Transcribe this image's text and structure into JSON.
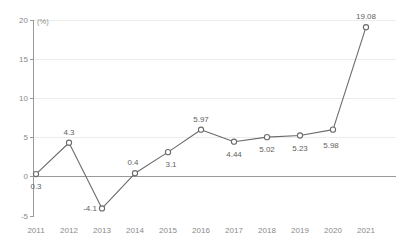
{
  "chart_data": {
    "type": "line",
    "title": "",
    "subtitle": "",
    "xlabel": "",
    "ylabel": "",
    "unit_label": "(%)",
    "categories": [
      "2011",
      "2012",
      "2013",
      "2014",
      "2015",
      "2016",
      "2017",
      "2018",
      "2019",
      "2020",
      "2021"
    ],
    "values": [
      0.3,
      4.3,
      -4.1,
      0.4,
      3.1,
      5.97,
      4.44,
      5.02,
      5.23,
      5.98,
      19.08
    ],
    "point_labels": [
      "0.3",
      "4.3",
      "-4.1",
      "0.4",
      "3.1",
      "5.97",
      "4.44",
      "5.02",
      "5.23",
      "5.98",
      "19.08"
    ],
    "label_positions": [
      "below",
      "above",
      "left",
      "above-left",
      "below-right",
      "above",
      "below",
      "below",
      "below",
      "below-left",
      "above"
    ],
    "ylim": [
      -5,
      20
    ],
    "yticks": [
      20,
      15,
      10,
      5,
      0,
      -5
    ],
    "ytick_labels": [
      "20",
      "15",
      "10",
      "5",
      "0",
      "-5"
    ],
    "grid": true,
    "grid_color": "#ececec",
    "zero_line_color": "#9a9a9a",
    "legend": "none",
    "series_color": "#6b6b6b",
    "marker": "open-circle"
  }
}
